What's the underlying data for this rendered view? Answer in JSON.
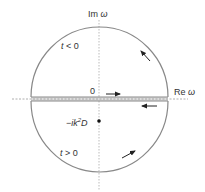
{
  "diagram": {
    "type": "contour-integral-complex-plane",
    "axes": {
      "imag_label_prefix": "Im ",
      "imag_label_var": "ω",
      "real_label_prefix": "Re ",
      "real_label_var": "ω",
      "origin_label": "0"
    },
    "regions": {
      "upper": {
        "label_var": "t",
        "label_rest": " < 0"
      },
      "lower": {
        "label_var": "t",
        "label_rest": " > 0"
      }
    },
    "pole": {
      "label_prefix": "−ik",
      "label_sup": "2",
      "label_suffix": "D"
    },
    "colors": {
      "contour": "#888888",
      "axis_dash": "#aaaaaa",
      "band_fill": "#dddddd",
      "arrow": "#222222",
      "pole": "#111111"
    }
  }
}
